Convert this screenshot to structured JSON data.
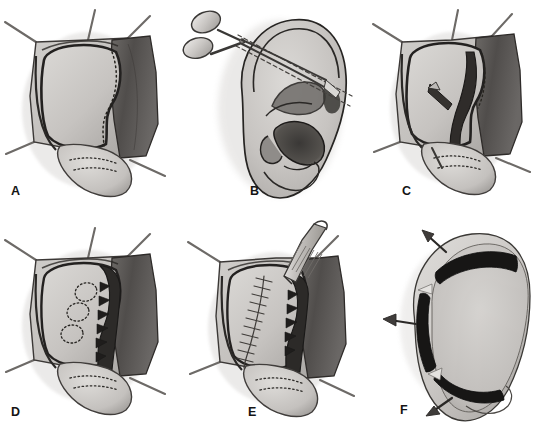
{
  "figure": {
    "style": "grayscale medical line illustration",
    "background_color": "#ffffff",
    "columns": 3,
    "rows": 2,
    "width": 539,
    "height": 434
  },
  "palette": {
    "ink": "#141414",
    "outline": "#2b2b2b",
    "skin_light": "#d8d6d3",
    "skin_mid": "#bcb9b6",
    "skin_shadow": "#8e8b88",
    "cartilage_light": "#cfcdc9",
    "flap_dark": "#575452",
    "flap_darker": "#3a3836",
    "cut_black": "#1a1a1a",
    "instrument_light": "#e3e1de",
    "instrument_mid": "#b3b0ad",
    "suture_thread": "#6f6c69",
    "arrow": "#4a4745",
    "background": "#ffffff"
  },
  "panels": [
    {
      "id": "A",
      "label": "A",
      "name": "panel-a-exposure",
      "caption": "Posterior ear exposure with skin flap retracted and antihelix marked",
      "label_x": 11,
      "label_y": 190,
      "elements": [
        "retraction-sutures",
        "retracted-skin-flap",
        "posterior-auricular-surface",
        "antihelix-ridge-outline",
        "dotted-marking-line",
        "lobule",
        "lobule-dotted-marks"
      ]
    },
    {
      "id": "B",
      "label": "B",
      "name": "panel-b-scissors-incision",
      "caption": "Lateral ear view with scissors and dashed planned incision lines through the antihelix",
      "label_x": 250,
      "label_y": 190,
      "elements": [
        "ear-lateral-view",
        "helix",
        "antihelix",
        "concha",
        "tragus",
        "antitragus",
        "lobule",
        "external-auditory-canal",
        "scissors",
        "dashed-incision-lines"
      ]
    },
    {
      "id": "C",
      "label": "C",
      "name": "panel-c-cartilage-incision",
      "caption": "Y-shaped cartilage incision created on posterior surface",
      "label_x": 402,
      "label_y": 190,
      "elements": [
        "retraction-sutures",
        "retracted-skin-flap",
        "posterior-auricular-surface",
        "y-shaped-cartilage-incision",
        "dotted-marking-line",
        "lobule",
        "lobule-dotted-marks"
      ]
    },
    {
      "id": "D",
      "label": "D",
      "name": "panel-d-scoring",
      "caption": "Cartilage scored with serrated edge and three circular dotted excision marks",
      "label_x": 11,
      "label_y": 412,
      "elements": [
        "retraction-sutures",
        "retracted-skin-flap",
        "cartilage-defect",
        "serrated-cut-edge",
        "circular-dotted-marks",
        "lobule",
        "lobule-dotted-marks"
      ]
    },
    {
      "id": "E",
      "label": "E",
      "name": "panel-e-suturing",
      "caption": "Running suture line closed with forceps holding the cartilage edge",
      "label_x": 248,
      "label_y": 412,
      "elements": [
        "retraction-sutures",
        "retracted-skin-flap",
        "running-suture-line",
        "serrated-cut-edge",
        "forceps-instrument",
        "lobule",
        "lobule-dotted-marks"
      ]
    },
    {
      "id": "F",
      "label": "F",
      "name": "panel-f-result",
      "caption": "Final antihelical fold with three arrows showing outward traction vectors",
      "label_x": 400,
      "label_y": 410,
      "elements": [
        "ear-posterior-result",
        "antihelical-fold-segments",
        "traction-arrow-superior",
        "traction-arrow-middle",
        "traction-arrow-inferior",
        "lobule"
      ],
      "arrows": 3
    }
  ]
}
